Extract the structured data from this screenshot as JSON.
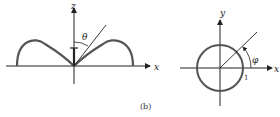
{
  "figure": {
    "caption": "(b)",
    "left_panel": {
      "title": "polar radiation lobes in x-z plane",
      "axis_x_label": "x",
      "axis_z_label": "z",
      "angle_label": "θ"
    },
    "right_panel": {
      "title": "circular pattern in x-y plane",
      "axis_x_label": "x",
      "axis_y_label": "y",
      "angle_label": "φ",
      "radius_label": "1"
    },
    "colors": {
      "stroke": "#222222",
      "curve": "#444444",
      "background": "#ffffff"
    }
  }
}
